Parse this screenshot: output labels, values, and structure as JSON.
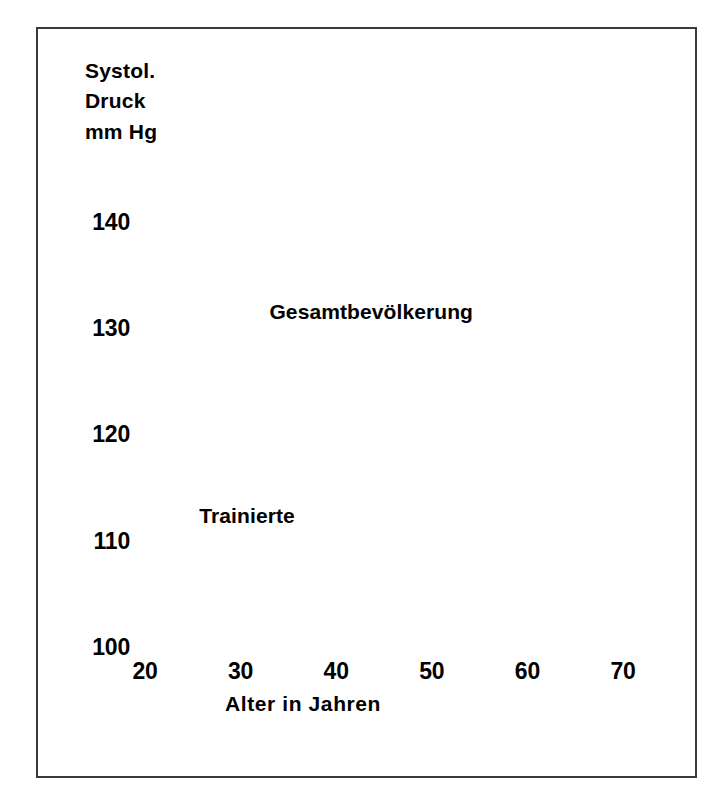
{
  "chart_data": {
    "type": "line",
    "title": "",
    "xlabel": "Alter  in  Jahren",
    "ylabel": "Systol.\nDruck\nmm Hg",
    "xlim": [
      20,
      70
    ],
    "ylim": [
      100,
      145
    ],
    "xticks": [
      "20",
      "30",
      "40",
      "50",
      "60",
      "70"
    ],
    "xtick_values": [
      20,
      30,
      40,
      50,
      60,
      70
    ],
    "yticks": [
      "100",
      "110",
      "120",
      "130",
      "140"
    ],
    "ytick_values": [
      100,
      110,
      120,
      130,
      140
    ],
    "grid": true,
    "legend": "inline-annotations",
    "series": [
      {
        "name": "Gesamtbevölkerung",
        "style": "solid",
        "marker": "open-circle",
        "x": [
          26,
          35,
          44,
          59,
          68.5
        ],
        "values": [
          120.3,
          122.0,
          125.3,
          134.3,
          145.0
        ],
        "label_x": 44,
        "label_y": 131.5
      },
      {
        "name": "Trainierte",
        "style": "dashed",
        "marker": "open-circle",
        "x": [
          26,
          35,
          55,
          59,
          68.5
        ],
        "values": [
          115.3,
          116.7,
          121.2,
          122.8,
          125.5
        ],
        "label_x": 33,
        "label_y": 112.5
      }
    ],
    "annotations": [
      {
        "name": "outlier-point",
        "marker": "open-circle",
        "x": 44,
        "y": 113.5
      }
    ]
  },
  "labels": {
    "y_axis_title": "Systol.\nDruck\nmm Hg",
    "x_axis_title": "Alter  in  Jahren",
    "series_population": "Gesamtbevölkerung",
    "series_trained": "Trainierte"
  },
  "colors": {
    "ink": "#000000",
    "frame": "#3a3a3a",
    "grid": "#1a1a1a",
    "marker_fill": "#ffffff",
    "background": "#ffffff"
  }
}
